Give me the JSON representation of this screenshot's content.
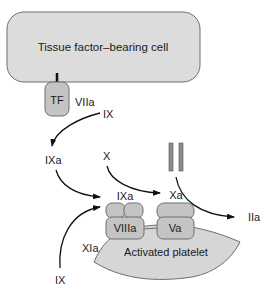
{
  "diagram": {
    "title": "",
    "colors": {
      "cell_fill": "#dcdcdc",
      "outline": "#6e6e6e",
      "protein_fill": "#c4c4c4",
      "platelet_fill": "#d6d6d6",
      "arrow": "#111111",
      "text": "#1a1a1a",
      "prothrombin_bar": "#8c8c8c"
    },
    "nodes": {
      "tf_cell": {
        "label": "Tissue factor–bearing cell"
      },
      "tf": {
        "label": "TF"
      },
      "viia": {
        "label": "VIIa"
      },
      "ix_top": {
        "label": "IX"
      },
      "ixa_free": {
        "label": "IXa"
      },
      "x": {
        "label": "X"
      },
      "ixa_complex": {
        "label": "IXa"
      },
      "viiia": {
        "label": "VIIIa"
      },
      "xa": {
        "label": "Xa"
      },
      "va": {
        "label": "Va"
      },
      "iia": {
        "label": "IIa"
      },
      "xia": {
        "label": "XIa"
      },
      "ix_bottom": {
        "label": "IX"
      },
      "platelet": {
        "label": "Activated platelet"
      }
    },
    "edges": [
      {
        "from": "IX",
        "to": "IXa",
        "via": "TF/VIIa"
      },
      {
        "from": "IXa",
        "to": "IXa/VIIIa complex"
      },
      {
        "from": "X",
        "to": "Xa"
      },
      {
        "from": "II (prothrombin)",
        "to": "IIa"
      },
      {
        "from": "IX",
        "to": "IXa/VIIIa complex",
        "via": "XIa"
      }
    ]
  }
}
